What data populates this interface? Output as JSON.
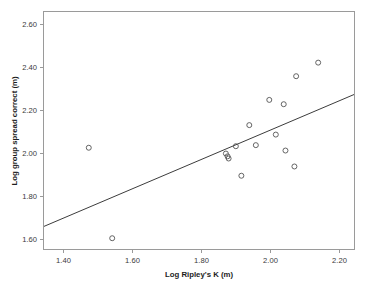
{
  "chart_data": {
    "type": "scatter",
    "title": "",
    "xlabel": "Log Ripley's K (m)",
    "ylabel": "Log group spread correct (m)",
    "xlim": [
      1.345,
      2.245
    ],
    "ylim": [
      1.555,
      2.655
    ],
    "xticks": [
      1.4,
      1.6,
      1.8,
      2.0,
      2.2
    ],
    "xtick_labels": [
      "1.40",
      "1.60",
      "1.80",
      "2.00",
      "2.20"
    ],
    "yticks": [
      1.6,
      1.8,
      2.0,
      2.2,
      2.4,
      2.6
    ],
    "ytick_labels": [
      "1.60",
      "1.80",
      "2.00",
      "2.20",
      "2.40",
      "2.60"
    ],
    "grid": false,
    "legend": false,
    "marker_style": "open-circle",
    "series": [
      {
        "name": "observations",
        "points": [
          {
            "x": 1.475,
            "y": 2.025
          },
          {
            "x": 1.543,
            "y": 1.605
          },
          {
            "x": 1.873,
            "y": 1.998
          },
          {
            "x": 1.878,
            "y": 1.985
          },
          {
            "x": 1.881,
            "y": 1.975
          },
          {
            "x": 1.902,
            "y": 2.032
          },
          {
            "x": 1.918,
            "y": 1.895
          },
          {
            "x": 1.941,
            "y": 2.13
          },
          {
            "x": 1.96,
            "y": 2.037
          },
          {
            "x": 1.999,
            "y": 2.247
          },
          {
            "x": 2.018,
            "y": 2.086
          },
          {
            "x": 2.041,
            "y": 2.227
          },
          {
            "x": 2.046,
            "y": 2.012
          },
          {
            "x": 2.072,
            "y": 1.938
          },
          {
            "x": 2.077,
            "y": 2.357
          },
          {
            "x": 2.141,
            "y": 2.42
          }
        ]
      }
    ],
    "trendline": {
      "name": "linear-fit",
      "x_start": 1.345,
      "y_start": 1.66,
      "x_end": 2.245,
      "y_end": 2.272
    }
  }
}
